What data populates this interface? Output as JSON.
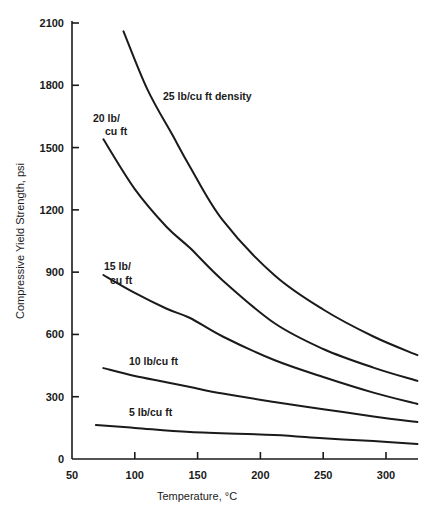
{
  "chart_data": {
    "type": "line",
    "title": "",
    "xlabel": "Temperature, °C",
    "ylabel": "Compressive Yield Strength, psi",
    "xlim": [
      50,
      325
    ],
    "ylim": [
      0,
      2100
    ],
    "grid": false,
    "legend_position": "inline labels",
    "x_ticks": [
      "50",
      "100",
      "150",
      "200",
      "250",
      "300"
    ],
    "y_ticks": [
      "0",
      "300",
      "600",
      "900",
      "1200",
      "1500",
      "1800",
      "2100"
    ],
    "series": [
      {
        "name": "25 lb/cu ft density",
        "label_lines": [
          "25 lb/cu ft density"
        ],
        "x": [
          91,
          110,
          130,
          144,
          170,
          211,
          250,
          290,
          325
        ],
        "y": [
          2060,
          1780,
          1560,
          1407,
          1150,
          886,
          720,
          590,
          500
        ]
      },
      {
        "name": "20 lb/cu ft",
        "label_lines": [
          "20 lb/",
          "cu ft"
        ],
        "x": [
          75,
          100,
          125,
          144,
          170,
          211,
          250,
          290,
          325
        ],
        "y": [
          1540,
          1300,
          1120,
          1016,
          860,
          655,
          530,
          440,
          376
        ]
      },
      {
        "name": "15 lb/cu ft",
        "label_lines": [
          "15 lb/",
          "cu ft"
        ],
        "x": [
          75,
          100,
          125,
          144,
          170,
          211,
          250,
          290,
          325
        ],
        "y": [
          886,
          800,
          725,
          679,
          590,
          477,
          395,
          320,
          265
        ]
      },
      {
        "name": "10 lb/cu ft",
        "label_lines": [
          "10 lb/cu ft"
        ],
        "x": [
          75,
          100,
          125,
          144,
          170,
          211,
          250,
          290,
          325
        ],
        "y": [
          438,
          400,
          370,
          347,
          315,
          275,
          240,
          205,
          178
        ]
      },
      {
        "name": "5 lb/cu ft",
        "label_lines": [
          "5 lb/cu ft"
        ],
        "x": [
          69,
          100,
          144,
          211,
          250,
          290,
          325
        ],
        "y": [
          164,
          150,
          130,
          116,
          100,
          86,
          72
        ]
      }
    ]
  }
}
